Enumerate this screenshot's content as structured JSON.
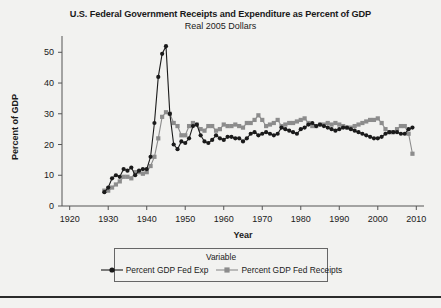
{
  "chart_data": {
    "type": "line",
    "title": "U.S. Federal Government Receipts and Expenditure as Percent of GDP",
    "subtitle": "Real 2005 Dollars",
    "xlabel": "Year",
    "ylabel": "Percent of GDP",
    "xlim": [
      1918,
      2012
    ],
    "ylim": [
      0,
      54
    ],
    "xticks": [
      1920,
      1930,
      1940,
      1950,
      1960,
      1970,
      1980,
      1990,
      2000,
      2010
    ],
    "yticks": [
      0,
      10,
      20,
      30,
      40,
      50
    ],
    "grid": false,
    "legend_position": "bottom",
    "legend_title": "Variable",
    "series": [
      {
        "name": "Percent GDP Fed Exp",
        "color": "#1a1a1a",
        "marker": "circle",
        "x": [
          1929,
          1930,
          1931,
          1932,
          1933,
          1934,
          1935,
          1936,
          1937,
          1938,
          1939,
          1940,
          1941,
          1942,
          1943,
          1944,
          1945,
          1946,
          1947,
          1948,
          1949,
          1950,
          1951,
          1952,
          1953,
          1954,
          1955,
          1956,
          1957,
          1958,
          1959,
          1960,
          1961,
          1962,
          1963,
          1964,
          1965,
          1966,
          1967,
          1968,
          1969,
          1970,
          1971,
          1972,
          1973,
          1974,
          1975,
          1976,
          1977,
          1978,
          1979,
          1980,
          1981,
          1982,
          1983,
          1984,
          1985,
          1986,
          1987,
          1988,
          1989,
          1990,
          1991,
          1992,
          1993,
          1994,
          1995,
          1996,
          1997,
          1998,
          1999,
          2000,
          2001,
          2002,
          2003,
          2004,
          2005,
          2006,
          2007,
          2008,
          2009
        ],
        "values": [
          4.5,
          6.0,
          9.0,
          10.0,
          9.5,
          12.0,
          11.5,
          12.5,
          10.0,
          11.5,
          12.0,
          12.0,
          16.0,
          27.0,
          42.0,
          49.5,
          52.0,
          30.0,
          20.0,
          18.5,
          21.0,
          20.5,
          22.0,
          26.0,
          26.5,
          23.0,
          21.0,
          20.5,
          21.5,
          23.0,
          22.0,
          21.5,
          22.5,
          22.5,
          22.0,
          22.0,
          21.0,
          22.0,
          23.5,
          24.0,
          23.0,
          23.5,
          24.0,
          23.5,
          23.0,
          23.5,
          25.5,
          25.0,
          24.5,
          24.0,
          23.5,
          25.0,
          25.5,
          26.5,
          27.0,
          26.0,
          26.5,
          26.0,
          25.5,
          25.0,
          24.5,
          25.0,
          25.5,
          25.5,
          25.0,
          24.5,
          24.0,
          23.5,
          23.0,
          22.5,
          22.0,
          22.0,
          22.5,
          23.5,
          24.0,
          24.0,
          24.0,
          23.5,
          23.5,
          25.0,
          25.5
        ]
      },
      {
        "name": "Percent GDP Fed Receipts",
        "color": "#8c8c8c",
        "marker": "square",
        "x": [
          1929,
          1930,
          1931,
          1932,
          1933,
          1934,
          1935,
          1936,
          1937,
          1938,
          1939,
          1940,
          1941,
          1942,
          1943,
          1944,
          1945,
          1946,
          1947,
          1948,
          1949,
          1950,
          1951,
          1952,
          1953,
          1954,
          1955,
          1956,
          1957,
          1958,
          1959,
          1960,
          1961,
          1962,
          1963,
          1964,
          1965,
          1966,
          1967,
          1968,
          1969,
          1970,
          1971,
          1972,
          1973,
          1974,
          1975,
          1976,
          1977,
          1978,
          1979,
          1980,
          1981,
          1982,
          1983,
          1984,
          1985,
          1986,
          1987,
          1988,
          1989,
          1990,
          1991,
          1992,
          1993,
          1994,
          1995,
          1996,
          1997,
          1998,
          1999,
          2000,
          2001,
          2002,
          2003,
          2004,
          2005,
          2006,
          2007,
          2008,
          2009
        ],
        "values": [
          5.0,
          5.0,
          6.0,
          7.0,
          8.0,
          9.5,
          9.5,
          9.0,
          11.0,
          11.0,
          10.5,
          11.0,
          13.0,
          16.0,
          22.0,
          29.0,
          30.5,
          30.0,
          27.0,
          26.0,
          23.0,
          23.0,
          26.0,
          27.0,
          26.5,
          25.0,
          24.5,
          26.0,
          26.0,
          24.5,
          25.0,
          26.5,
          26.0,
          26.0,
          26.5,
          26.0,
          25.5,
          27.0,
          27.0,
          28.0,
          29.5,
          28.0,
          26.0,
          26.5,
          27.0,
          28.0,
          26.0,
          26.5,
          27.0,
          27.0,
          27.5,
          28.0,
          28.5,
          27.0,
          26.0,
          26.0,
          26.5,
          26.5,
          27.0,
          26.5,
          27.0,
          26.5,
          26.0,
          25.5,
          25.5,
          26.0,
          26.5,
          27.0,
          27.5,
          28.0,
          28.0,
          28.5,
          27.0,
          25.0,
          24.0,
          24.0,
          25.0,
          26.0,
          26.0,
          23.5,
          17.0
        ]
      }
    ]
  },
  "legend": {
    "title": "Variable",
    "entries": [
      {
        "label": "Percent GDP Fed Exp",
        "color": "#1a1a1a",
        "marker": "circle"
      },
      {
        "label": "Percent GDP Fed Receipts",
        "color": "#8c8c8c",
        "marker": "square"
      }
    ]
  }
}
